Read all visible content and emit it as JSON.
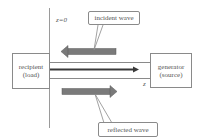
{
  "diagram": {
    "title": "",
    "labels": {
      "z0": "z=0",
      "z_axis": "z"
    },
    "recipient": {
      "line1": "recipient",
      "line2": "(load)"
    },
    "generator": {
      "line1": "generator",
      "line2": "(source)"
    },
    "callouts": {
      "incident": "incident wave",
      "reflected": "reflected wave"
    },
    "colors": {
      "line": "#8a8a8a",
      "wave_arrow": "#7a7a7a",
      "main_arrow": "#333333",
      "text": "#555555"
    }
  }
}
